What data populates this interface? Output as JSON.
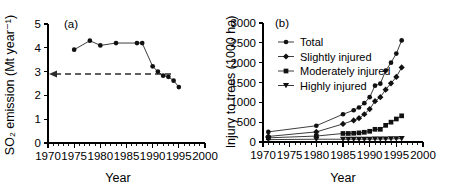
{
  "figure": {
    "panel_a_label": "(a)",
    "panel_b_label": "(b)"
  },
  "chart_data": [
    {
      "panel": "(a)",
      "type": "line",
      "title": "",
      "xlabel": "Year",
      "ylabel": "SO₂ emission (Mt year⁻¹)",
      "xlim": [
        1970,
        2000
      ],
      "ylim": [
        0,
        5
      ],
      "xticks": [
        1970,
        1975,
        1980,
        1985,
        1990,
        1995,
        2000
      ],
      "xtick_labels": [
        "1970",
        "1975",
        "1980",
        "1985",
        "1990",
        "1995",
        "2000"
      ],
      "yticks": [
        0,
        1,
        2,
        3,
        4,
        5
      ],
      "ytick_labels": [
        "0",
        "1",
        "2",
        "3",
        "4",
        "5"
      ],
      "minor_tick_step_x": 1,
      "grid": false,
      "legend": false,
      "annotations": [
        {
          "kind": "threshold-dashed-line",
          "y": 2.9,
          "arrow": "left",
          "label": ""
        }
      ],
      "series": [
        {
          "name": "SO2 emission",
          "marker": "filled-circle",
          "x": [
            1975,
            1978,
            1980,
            1983,
            1987,
            1988,
            1990,
            1991,
            1992,
            1993,
            1994,
            1995
          ],
          "values": [
            3.92,
            4.3,
            4.1,
            4.2,
            4.2,
            4.2,
            3.22,
            3.0,
            2.83,
            2.78,
            2.62,
            2.35
          ]
        }
      ]
    },
    {
      "panel": "(b)",
      "type": "line",
      "title": "",
      "xlabel": "Year",
      "ylabel": "Injury to trees (1000 ha)",
      "xlim": [
        1970,
        2000
      ],
      "ylim": [
        0,
        3000
      ],
      "xticks": [
        1970,
        1975,
        1980,
        1985,
        1990,
        1995,
        2000
      ],
      "xtick_labels": [
        "1970",
        "1975",
        "1980",
        "1985",
        "1990",
        "1995",
        "2000"
      ],
      "yticks": [
        0,
        500,
        1000,
        1500,
        2000,
        2500,
        3000
      ],
      "ytick_labels": [
        "0",
        "500",
        "1000",
        "1500",
        "2000",
        "2500",
        "3000"
      ],
      "minor_tick_step_x": 1,
      "grid": false,
      "legend": true,
      "legend_position": "upper-left",
      "series": [
        {
          "name": "Total",
          "marker": "filled-circle",
          "x": [
            1971,
            1980,
            1985,
            1987,
            1988,
            1989,
            1990,
            1991,
            1992,
            1993,
            1994,
            1995,
            1996
          ],
          "values": [
            255,
            410,
            700,
            800,
            870,
            980,
            1130,
            1420,
            1470,
            1800,
            2000,
            2230,
            2560
          ]
        },
        {
          "name": "Slightly injured",
          "marker": "filled-diamond",
          "x": [
            1971,
            1980,
            1985,
            1987,
            1988,
            1989,
            1990,
            1991,
            1992,
            1993,
            1994,
            1995,
            1996
          ],
          "values": [
            140,
            255,
            455,
            545,
            600,
            700,
            830,
            1030,
            1130,
            1320,
            1480,
            1640,
            1880
          ]
        },
        {
          "name": "Moderately injured",
          "marker": "filled-square",
          "x": [
            1971,
            1980,
            1985,
            1986,
            1987,
            1988,
            1989,
            1990,
            1991,
            1992,
            1993,
            1994,
            1995,
            1996
          ],
          "values": [
            105,
            150,
            215,
            215,
            220,
            230,
            245,
            270,
            320,
            320,
            420,
            500,
            580,
            660
          ]
        },
        {
          "name": "Highly injured",
          "marker": "filled-triangle-down",
          "x": [
            1971,
            1980,
            1985,
            1986,
            1987,
            1988,
            1989,
            1990,
            1991,
            1992,
            1993,
            1994,
            1995,
            1996
          ],
          "values": [
            60,
            70,
            70,
            70,
            70,
            70,
            70,
            72,
            75,
            75,
            78,
            80,
            82,
            85
          ]
        }
      ]
    }
  ]
}
